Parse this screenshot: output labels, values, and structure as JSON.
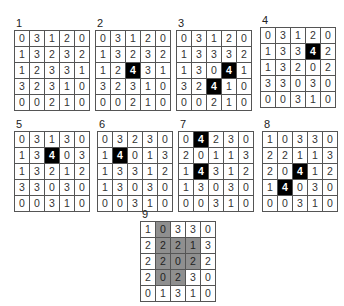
{
  "panels": [
    {
      "label": "1",
      "x": 14,
      "y": 17,
      "rows": [
        [
          0,
          3,
          1,
          2,
          0
        ],
        [
          1,
          3,
          2,
          3,
          2
        ],
        [
          1,
          2,
          3,
          3,
          1
        ],
        [
          3,
          2,
          3,
          1,
          0
        ],
        [
          0,
          0,
          2,
          1,
          0
        ]
      ],
      "highlight": []
    },
    {
      "label": "2",
      "x": 95,
      "y": 17,
      "rows": [
        [
          0,
          3,
          1,
          2,
          0
        ],
        [
          1,
          3,
          2,
          3,
          2
        ],
        [
          1,
          2,
          4,
          3,
          1
        ],
        [
          3,
          2,
          3,
          1,
          0
        ],
        [
          0,
          0,
          2,
          1,
          0
        ]
      ],
      "highlight": [
        [
          2,
          2
        ]
      ]
    },
    {
      "label": "3",
      "x": 176,
      "y": 17,
      "rows": [
        [
          0,
          3,
          1,
          2,
          0
        ],
        [
          1,
          3,
          3,
          3,
          2
        ],
        [
          1,
          3,
          0,
          4,
          1
        ],
        [
          3,
          2,
          4,
          1,
          0
        ],
        [
          0,
          0,
          2,
          1,
          0
        ]
      ],
      "highlight": [
        [
          2,
          3
        ],
        [
          3,
          2
        ]
      ]
    },
    {
      "label": "4",
      "x": 260,
      "y": 14,
      "rows": [
        [
          0,
          3,
          1,
          2,
          0
        ],
        [
          1,
          3,
          3,
          4,
          2
        ],
        [
          1,
          3,
          2,
          0,
          2
        ],
        [
          3,
          3,
          0,
          3,
          0
        ],
        [
          0,
          0,
          3,
          1,
          0
        ]
      ],
      "highlight": [
        [
          1,
          3
        ]
      ]
    },
    {
      "label": "5",
      "x": 14,
      "y": 118,
      "rows": [
        [
          0,
          3,
          1,
          3,
          0
        ],
        [
          1,
          3,
          4,
          0,
          3
        ],
        [
          1,
          3,
          2,
          1,
          2
        ],
        [
          3,
          3,
          0,
          3,
          0
        ],
        [
          0,
          0,
          3,
          1,
          0
        ]
      ],
      "highlight": [
        [
          1,
          2
        ]
      ]
    },
    {
      "label": "6",
      "x": 97,
      "y": 118,
      "rows": [
        [
          0,
          3,
          2,
          3,
          0
        ],
        [
          1,
          4,
          0,
          1,
          3
        ],
        [
          1,
          3,
          3,
          1,
          2
        ],
        [
          1,
          3,
          0,
          3,
          0
        ],
        [
          0,
          0,
          3,
          1,
          0
        ]
      ],
      "highlight": [
        [
          1,
          1
        ]
      ]
    },
    {
      "label": "7",
      "x": 178,
      "y": 118,
      "rows": [
        [
          0,
          4,
          2,
          3,
          0
        ],
        [
          2,
          0,
          1,
          1,
          3
        ],
        [
          1,
          4,
          3,
          1,
          2
        ],
        [
          1,
          3,
          0,
          3,
          0
        ],
        [
          0,
          0,
          3,
          1,
          0
        ]
      ],
      "highlight": [
        [
          0,
          1
        ],
        [
          2,
          1
        ]
      ]
    },
    {
      "label": "8",
      "x": 262,
      "y": 118,
      "rows": [
        [
          1,
          0,
          3,
          3,
          0
        ],
        [
          2,
          2,
          1,
          1,
          3
        ],
        [
          2,
          0,
          4,
          1,
          2
        ],
        [
          1,
          4,
          0,
          3,
          0
        ],
        [
          0,
          0,
          3,
          1,
          0
        ]
      ],
      "highlight": [
        [
          2,
          2
        ],
        [
          3,
          1
        ]
      ]
    },
    {
      "label": "9",
      "x": 140,
      "y": 208,
      "rows": [
        [
          1,
          0,
          3,
          3,
          0
        ],
        [
          2,
          2,
          2,
          1,
          3
        ],
        [
          2,
          2,
          0,
          2,
          2
        ],
        [
          2,
          0,
          2,
          3,
          0
        ],
        [
          0,
          1,
          3,
          1,
          0
        ]
      ],
      "highlight": [],
      "gray": [
        [
          0,
          1
        ],
        [
          1,
          1
        ],
        [
          1,
          2
        ],
        [
          1,
          3
        ],
        [
          2,
          1
        ],
        [
          2,
          2
        ],
        [
          2,
          3
        ],
        [
          3,
          1
        ],
        [
          3,
          2
        ]
      ]
    }
  ]
}
